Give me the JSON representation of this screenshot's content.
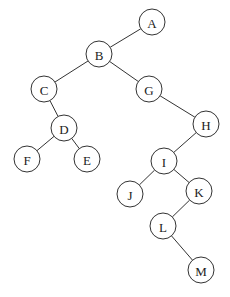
{
  "diagram": {
    "type": "binary-tree",
    "radius": 13,
    "nodes": [
      {
        "id": "A",
        "label": "A",
        "x": 152,
        "y": 22
      },
      {
        "id": "B",
        "label": "B",
        "x": 99,
        "y": 54
      },
      {
        "id": "C",
        "label": "C",
        "x": 44,
        "y": 89
      },
      {
        "id": "G",
        "label": "G",
        "x": 149,
        "y": 89
      },
      {
        "id": "D",
        "label": "D",
        "x": 64,
        "y": 128
      },
      {
        "id": "H",
        "label": "H",
        "x": 206,
        "y": 124
      },
      {
        "id": "F",
        "label": "F",
        "x": 27,
        "y": 159
      },
      {
        "id": "E",
        "label": "E",
        "x": 87,
        "y": 159
      },
      {
        "id": "I",
        "label": "I",
        "x": 164,
        "y": 161
      },
      {
        "id": "J",
        "label": "J",
        "x": 130,
        "y": 194
      },
      {
        "id": "K",
        "label": "K",
        "x": 199,
        "y": 191
      },
      {
        "id": "L",
        "label": "L",
        "x": 163,
        "y": 226
      },
      {
        "id": "M",
        "label": "M",
        "x": 201,
        "y": 270
      }
    ],
    "edges": [
      {
        "from": "A",
        "to": "B"
      },
      {
        "from": "B",
        "to": "C"
      },
      {
        "from": "B",
        "to": "G"
      },
      {
        "from": "C",
        "to": "D"
      },
      {
        "from": "D",
        "to": "F"
      },
      {
        "from": "D",
        "to": "E"
      },
      {
        "from": "G",
        "to": "H"
      },
      {
        "from": "H",
        "to": "I"
      },
      {
        "from": "I",
        "to": "J"
      },
      {
        "from": "I",
        "to": "K"
      },
      {
        "from": "K",
        "to": "L"
      },
      {
        "from": "L",
        "to": "M"
      }
    ]
  }
}
